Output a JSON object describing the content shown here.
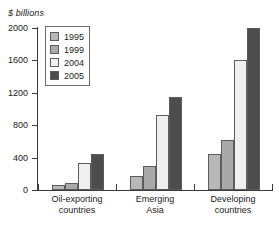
{
  "chart_data": {
    "type": "bar",
    "title": "$ billions",
    "xlabel": "",
    "ylabel": "$ billions",
    "ylim": [
      0,
      2000
    ],
    "yticks": [
      0,
      400,
      800,
      1200,
      1600,
      2000
    ],
    "ytick_labels": [
      "0",
      "400",
      "800",
      "1200",
      "1600",
      "2000"
    ],
    "grid": false,
    "legend_position": "upper-left-inside",
    "categories": [
      "Oil-exporting countries",
      "Emerging Asia",
      "Developing countries"
    ],
    "category_lines": [
      [
        "Oil-exporting",
        "countries"
      ],
      [
        "Emerging",
        "Asia"
      ],
      [
        "Developing",
        "countries"
      ]
    ],
    "series": [
      {
        "name": "1995",
        "color": "#b8b8b8",
        "values": [
          60,
          170,
          440
        ]
      },
      {
        "name": "1999",
        "color": "#a9a9a9",
        "values": [
          90,
          300,
          620
        ]
      },
      {
        "name": "2004",
        "color": "#efefef",
        "values": [
          330,
          920,
          1610
        ]
      },
      {
        "name": "2005",
        "color": "#4d4d4d",
        "values": [
          440,
          1150,
          2000
        ]
      }
    ]
  }
}
